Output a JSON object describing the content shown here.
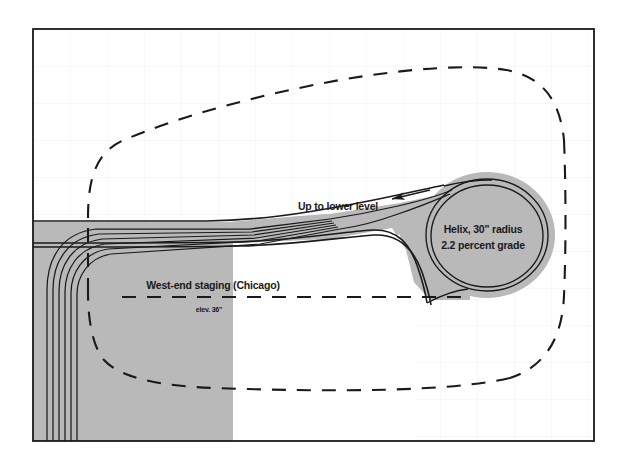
{
  "diagram": {
    "type": "track-plan",
    "frame": {
      "x": 33,
      "y": 29,
      "width": 561,
      "height": 412,
      "border_color": "#1a1a1a",
      "background_color": "#ffffff"
    },
    "grid": {
      "visible": true,
      "spacing_px": 37,
      "color": "#f0f0f0"
    },
    "colors": {
      "roadbed_fill": "#b9b9b9",
      "track_line": "#1a1a1a",
      "benchwork_dash": "#1a1a1a",
      "label_text": "#1a1a1a"
    },
    "labels": [
      {
        "name": "up-to-lower-level",
        "text": "Up to lower level",
        "x": 338,
        "y": 210,
        "anchor": "middle",
        "size": "main"
      },
      {
        "name": "helix-radius",
        "text": "Helix, 30\" radius",
        "x": 483,
        "y": 233,
        "anchor": "middle",
        "size": "main"
      },
      {
        "name": "helix-grade",
        "text": "2.2 percent grade",
        "x": 483,
        "y": 249,
        "anchor": "middle",
        "size": "main"
      },
      {
        "name": "west-end-staging",
        "text": "West-end staging (Chicago)",
        "x": 213,
        "y": 289,
        "anchor": "middle",
        "size": "main"
      },
      {
        "name": "staging-elevation",
        "text": "elev. 36\"",
        "x": 209,
        "y": 312,
        "anchor": "middle",
        "size": "small"
      }
    ],
    "annotations": {
      "helix_radius_value": "30\"",
      "helix_grade_value": "2.2 percent",
      "staging_elevation_value": "36\"",
      "staging_track_count": 6,
      "arrow_direction": "left",
      "arrow_meaning": "train travel direction up to lower level"
    },
    "benchwork_outline": {
      "name": "benchwork-dashed-outline",
      "style": "dashed",
      "dash_pattern": "14 11",
      "stroke_width": 2.1
    }
  }
}
